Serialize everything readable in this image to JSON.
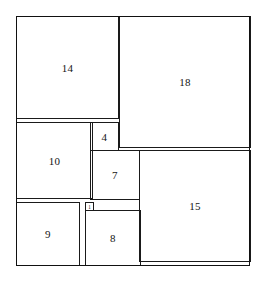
{
  "figure": {
    "background_color": "#ffffff",
    "line_color": "#1a1a1a",
    "label_color": "#141414",
    "outer": {
      "label": "outer rectangle",
      "x": 16,
      "y": 16,
      "width": 234,
      "height": 250,
      "units_width": 33,
      "units_height": 32
    },
    "unit_scale_px": 7.5,
    "squares": [
      {
        "label": "14",
        "size_units": 14,
        "x": 16,
        "y": 16,
        "size": 103
      },
      {
        "label": "18",
        "size_units": 18,
        "x": 119,
        "y": 16,
        "size": 132
      },
      {
        "label": "10",
        "size_units": 10,
        "x": 16,
        "y": 122,
        "size": 77
      },
      {
        "label": "4",
        "size_units": 4,
        "x": 90,
        "y": 122,
        "size": 29
      },
      {
        "label": "7",
        "size_units": 7,
        "x": 90,
        "y": 150,
        "size": 50
      },
      {
        "label": "15",
        "size_units": 15,
        "x": 139,
        "y": 150,
        "size": 112
      },
      {
        "label": "1",
        "size_units": 1,
        "x": 85,
        "y": 202,
        "size": 9
      },
      {
        "label": "9",
        "size_units": 9,
        "x": 16,
        "y": 202,
        "size": 64
      },
      {
        "label": "8",
        "size_units": 8,
        "x": 85,
        "y": 210,
        "size": 56
      }
    ]
  }
}
